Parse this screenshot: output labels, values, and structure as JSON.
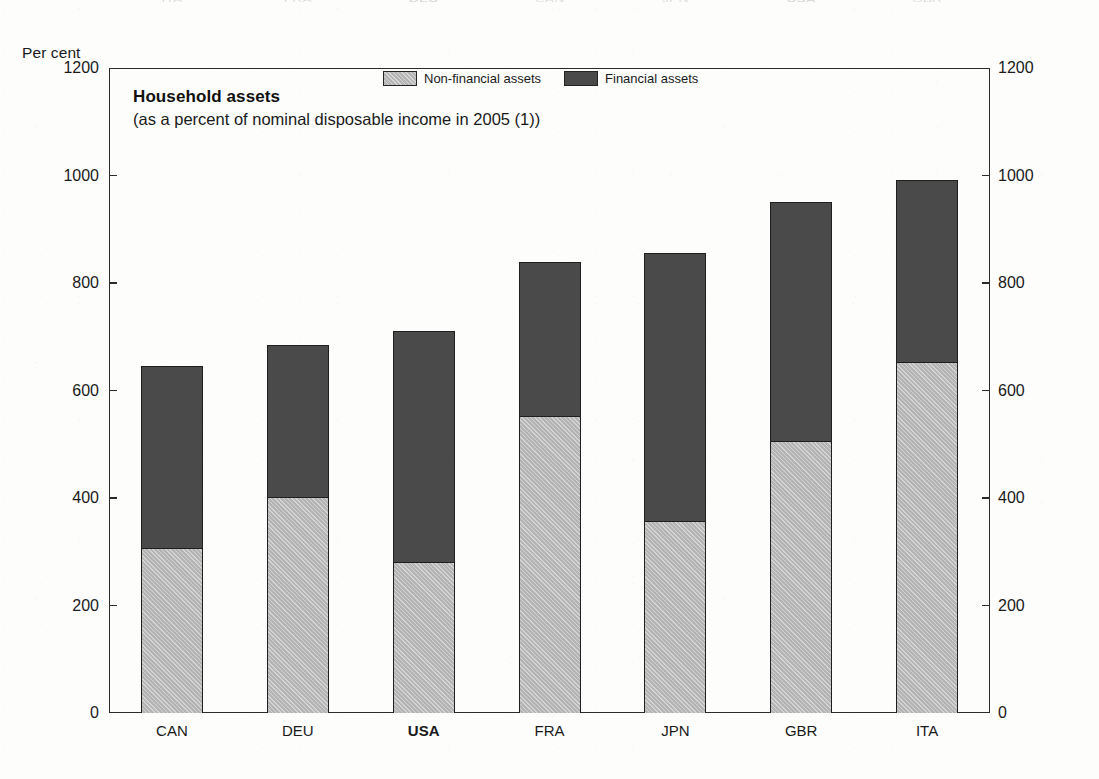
{
  "axis_note": "Per cent",
  "legend": [
    {
      "id": "non-financial",
      "label": "Non-financial assets",
      "color": "#b4b4b4"
    },
    {
      "id": "financial",
      "label": "Financial assets",
      "color": "#4a4a4a"
    }
  ],
  "title": "Household assets",
  "subtitle": "(as a percent of nominal disposable income in 2005 (1))",
  "ghost_row": {
    "labels": [
      "ITA",
      "FRA",
      "DEU",
      "CAN",
      "JPN",
      "USA",
      "GBR"
    ],
    "bold": [
      "DEU",
      "USA"
    ]
  },
  "chart_data": {
    "type": "bar",
    "stacked": true,
    "title": "Household assets",
    "subtitle": "(as a percent of nominal disposable income in 2005 (1))",
    "xlabel": "",
    "ylabel": "Per cent",
    "ylim": [
      0,
      1200
    ],
    "yticks": [
      0,
      200,
      400,
      600,
      800,
      1000,
      1200
    ],
    "ytick_labels": [
      "0",
      "200",
      "400",
      "600",
      "800",
      "1000",
      "1200"
    ],
    "grid": false,
    "legend_position": "top-center",
    "dual_y_axis": true,
    "categories": [
      "CAN",
      "DEU",
      "USA",
      "FRA",
      "JPN",
      "GBR",
      "ITA"
    ],
    "highlighted_category": "USA",
    "series": [
      {
        "name": "Non-financial assets",
        "color": "#b4b4b4",
        "values": [
          305,
          400,
          280,
          550,
          355,
          505,
          652
        ]
      },
      {
        "name": "Financial assets",
        "color": "#4a4a4a",
        "values": [
          340,
          285,
          430,
          290,
          500,
          445,
          340
        ]
      }
    ],
    "totals": [
      645,
      685,
      710,
      840,
      855,
      950,
      992
    ]
  }
}
